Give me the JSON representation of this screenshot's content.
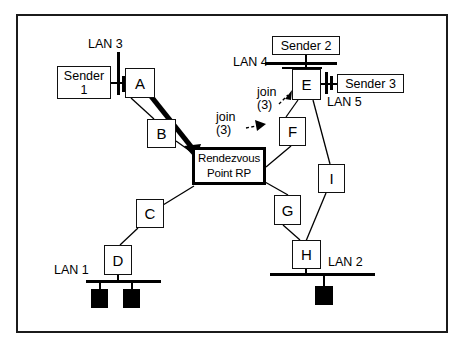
{
  "diagram": {
    "background": "#ffffff",
    "line_color": "#000000",
    "frame_color": "#1b1b1b"
  },
  "routers": [
    {
      "id": "A",
      "label": "A",
      "x": 125,
      "y": 68,
      "w": 30,
      "h": 30
    },
    {
      "id": "B",
      "label": "B",
      "x": 147,
      "y": 119,
      "w": 29,
      "h": 29
    },
    {
      "id": "C",
      "label": "C",
      "x": 136,
      "y": 199,
      "w": 28,
      "h": 29
    },
    {
      "id": "D",
      "label": "D",
      "x": 104,
      "y": 245,
      "w": 28,
      "h": 30
    },
    {
      "id": "E",
      "label": "E",
      "x": 292,
      "y": 69,
      "w": 29,
      "h": 31
    },
    {
      "id": "F",
      "label": "F",
      "x": 279,
      "y": 117,
      "w": 27,
      "h": 29
    },
    {
      "id": "G",
      "label": "G",
      "x": 274,
      "y": 195,
      "w": 27,
      "h": 30
    },
    {
      "id": "H",
      "label": "H",
      "x": 292,
      "y": 240,
      "w": 29,
      "h": 29
    },
    {
      "id": "I",
      "label": "I",
      "x": 318,
      "y": 164,
      "w": 27,
      "h": 29
    }
  ],
  "rendezvous_point": {
    "line1": "Rendezvous",
    "line2": "Point  RP",
    "x": 192,
    "y": 147,
    "w": 74,
    "h": 38
  },
  "senders": [
    {
      "id": "sender-1",
      "line1": "Sender",
      "line2": "1",
      "x": 57,
      "y": 66,
      "w": 54,
      "h": 33
    },
    {
      "id": "sender-2",
      "line1": "Sender 2",
      "line2": "",
      "x": 272,
      "y": 36,
      "w": 68,
      "h": 19
    },
    {
      "id": "sender-3",
      "line1": "Sender 3",
      "line2": "",
      "x": 337,
      "y": 74,
      "w": 67,
      "h": 19
    }
  ],
  "lans": [
    {
      "id": "lan-1",
      "label": "LAN 1",
      "label_x": 56,
      "label_y": 265,
      "orientation": "horizontal"
    },
    {
      "id": "lan-2",
      "label": "LAN 2",
      "label_x": 327,
      "label_y": 256,
      "orientation": "horizontal"
    },
    {
      "id": "lan-3",
      "label": "LAN 3",
      "label_x": 88,
      "label_y": 38,
      "orientation": "vertical"
    },
    {
      "id": "lan-4",
      "label": "LAN 4",
      "label_x": 233,
      "label_y": 57,
      "orientation": "horizontal"
    },
    {
      "id": "lan-5",
      "label": "LAN 5",
      "label_x": 327,
      "label_y": 97,
      "orientation": "vertical"
    }
  ],
  "annotations": [
    {
      "id": "join-upper",
      "line1": "join",
      "line2": "(3)",
      "x": 258,
      "y": 88
    },
    {
      "id": "join-lower",
      "line1": "join",
      "line2": "(3)",
      "x": 217,
      "y": 113
    }
  ],
  "hosts": [
    {
      "id": "lan1-host-1",
      "x": 91,
      "y": 289,
      "w": 17,
      "h": 19
    },
    {
      "id": "lan1-host-2",
      "x": 123,
      "y": 289,
      "w": 17,
      "h": 19
    },
    {
      "id": "lan2-host-1",
      "x": 315,
      "y": 286,
      "w": 18,
      "h": 19
    }
  ],
  "links": [
    {
      "from": "A",
      "to": "B",
      "style": "thin"
    },
    {
      "from": "B",
      "to": "RP",
      "style": "thin"
    },
    {
      "from": "A",
      "to": "RP",
      "style": "thick-arrow"
    },
    {
      "from": "RP",
      "to": "C",
      "style": "thin"
    },
    {
      "from": "C",
      "to": "D",
      "style": "thin"
    },
    {
      "from": "RP",
      "to": "F",
      "style": "thin"
    },
    {
      "from": "F",
      "to": "E",
      "style": "thin"
    },
    {
      "from": "E",
      "to": "I",
      "style": "thin"
    },
    {
      "from": "RP",
      "to": "G",
      "style": "thin"
    },
    {
      "from": "G",
      "to": "H",
      "style": "thin"
    },
    {
      "from": "I",
      "to": "H",
      "style": "thin"
    },
    {
      "from": "join-upper",
      "to": "E",
      "style": "dashed-arrow"
    },
    {
      "from": "join-lower",
      "to": "F",
      "style": "dashed-arrow"
    }
  ]
}
